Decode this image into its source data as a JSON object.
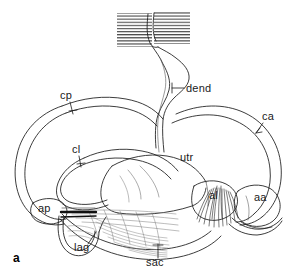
{
  "figure": {
    "panel_letter": "a",
    "background_color": "#ffffff",
    "ink_color": "#1a1a1a"
  },
  "labels": [
    {
      "id": "cp",
      "text": "cp",
      "full_name": "posterior semicircular canal",
      "x": 60,
      "y": 97,
      "leader": "tick-down"
    },
    {
      "id": "dend",
      "text": "dend",
      "full_name": "dendrites",
      "x": 186,
      "y": 91,
      "leader": "horizontal-left"
    },
    {
      "id": "ca",
      "text": "ca",
      "full_name": "anterior semicircular canal",
      "x": 262,
      "y": 118,
      "leader": "arrow-down-left"
    },
    {
      "id": "cl",
      "text": "cl",
      "full_name": "lateral semicircular canal",
      "x": 72,
      "y": 151,
      "leader": "tick-down"
    },
    {
      "id": "utr",
      "text": "utr",
      "full_name": "utriculus",
      "x": 180,
      "y": 158,
      "leader": "none"
    },
    {
      "id": "al",
      "text": "al",
      "full_name": "lateral ampulla",
      "x": 209,
      "y": 196,
      "leader": "none"
    },
    {
      "id": "aa",
      "text": "aa",
      "full_name": "anterior ampulla",
      "x": 254,
      "y": 198,
      "leader": "none"
    },
    {
      "id": "ap",
      "text": "ap",
      "full_name": "posterior ampulla",
      "x": 38,
      "y": 209,
      "leader": "none"
    },
    {
      "id": "lag",
      "text": "lag",
      "full_name": "lagena",
      "x": 74,
      "y": 247,
      "leader": "diagonal-up-right"
    },
    {
      "id": "sac",
      "text": "sac",
      "full_name": "sacculus",
      "x": 150,
      "y": 262,
      "leader": "vertical-up-tick"
    }
  ]
}
